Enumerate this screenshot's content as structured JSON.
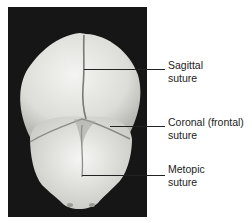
{
  "figure": {
    "photo_description": "Superior view of infant skull showing sutures",
    "labels": [
      {
        "id": "sagittal",
        "line1": "Sagittal",
        "line2": "suture"
      },
      {
        "id": "coronal",
        "line1": "Coronal (frontal)",
        "line2": "suture"
      },
      {
        "id": "metopic",
        "line1": "Metopic",
        "line2": "suture"
      }
    ]
  }
}
